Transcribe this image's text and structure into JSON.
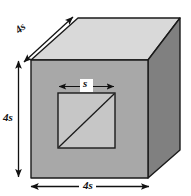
{
  "figure": {
    "type": "geometry-diagram",
    "labels": {
      "depth_edge": "4s",
      "height_edge": "4s",
      "width_edge": "4s",
      "hole_side": "s"
    },
    "colors": {
      "top_face": "#d9d9d9",
      "front_face": "#a8a8a8",
      "right_face": "#808080",
      "hole_face": "#c6c6c6",
      "outline": "#1a1a1a",
      "background": "#ffffff",
      "label_text": "#111111"
    },
    "geometry": {
      "front_face": [
        [
          31,
          60
        ],
        [
          148,
          60
        ],
        [
          148,
          178
        ],
        [
          31,
          178
        ]
      ],
      "top_face": [
        [
          31,
          60
        ],
        [
          78,
          18
        ],
        [
          180,
          18
        ],
        [
          148,
          60
        ]
      ],
      "right_face": [
        [
          148,
          60
        ],
        [
          180,
          18
        ],
        [
          180,
          150
        ],
        [
          148,
          178
        ]
      ],
      "hole_square": [
        [
          58,
          93
        ],
        [
          115,
          93
        ],
        [
          115,
          148
        ],
        [
          58,
          148
        ]
      ],
      "hole_diagonal": [
        [
          58,
          148
        ],
        [
          115,
          93
        ]
      ]
    },
    "dimension_arrows": {
      "depth": {
        "from": [
          23,
          62
        ],
        "to": [
          72,
          18
        ],
        "label": "4s",
        "orientation": "diagonal"
      },
      "height": {
        "from": [
          18,
          60
        ],
        "to": [
          18,
          178
        ],
        "label": "4s",
        "orientation": "vertical"
      },
      "width": {
        "from": [
          30,
          186
        ],
        "to": [
          150,
          186
        ],
        "label": "4s",
        "orientation": "horizontal"
      },
      "hole_side": {
        "from": [
          59,
          86
        ],
        "to": [
          114,
          86
        ],
        "label": "s",
        "orientation": "horizontal"
      }
    }
  }
}
